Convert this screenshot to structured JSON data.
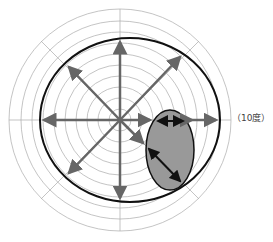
{
  "diagram": {
    "type": "visual-field-polar",
    "scale_label": "（10度）",
    "rings": 10,
    "ring_step_deg": 10,
    "colors": {
      "grid": "#999999",
      "arrow": "#666666",
      "outline": "#111111",
      "shaded": "#999999"
    }
  }
}
